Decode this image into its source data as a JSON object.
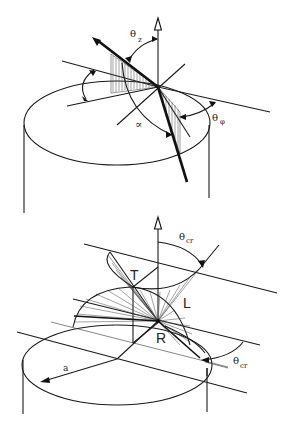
{
  "figure_top": {
    "labels": {
      "theta_z": "θ",
      "theta_z_sub": "z",
      "theta_phi": "θ",
      "theta_phi_sub": "φ",
      "alpha": "∝"
    }
  },
  "figure_bottom": {
    "labels": {
      "theta_cr_top": "θ",
      "theta_cr_top_sub": "cr",
      "theta_cr_right": "θ",
      "theta_cr_right_sub": "cr",
      "T": "T",
      "L": "L",
      "R": "R",
      "a": "a"
    }
  },
  "colors": {
    "ink": "#1a1a1a",
    "background": "#ffffff"
  }
}
